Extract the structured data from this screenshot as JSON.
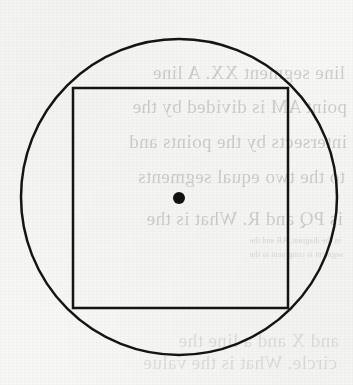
{
  "page": {
    "width": 353,
    "height": 385,
    "background_color": "#f7f7f5",
    "ink_color": "#141414"
  },
  "figure": {
    "name": "circle-with-inscribed-square",
    "stroke_color": "#141414",
    "stroke_width": 2.5,
    "circle": {
      "label": "circle",
      "center_x": 179,
      "center_y": 197,
      "radius": 158
    },
    "square": {
      "label": "inscribed-square",
      "left": 73,
      "top": 88,
      "right": 288,
      "bottom": 308,
      "width": 215,
      "height": 220
    },
    "center_point": {
      "label": "centre",
      "x": 179,
      "y": 198,
      "radius": 6,
      "fill": "#111111"
    }
  },
  "ghost_text": {
    "note": "Faint mirrored show-through text from the reverse of the scanned page",
    "lines": [
      {
        "text": "line segment XX. A line",
        "x": 8,
        "y": 62,
        "size": "main"
      },
      {
        "text": "point AM is divided by the",
        "x": 6,
        "y": 96,
        "size": "main"
      },
      {
        "text": "intersects by the points  and",
        "x": 6,
        "y": 131,
        "size": "main"
      },
      {
        "text": "to the two equal segments",
        "x": 8,
        "y": 166,
        "size": "main"
      },
      {
        "text": "is PQ and R. What is the",
        "x": 10,
        "y": 208,
        "size": "main"
      },
      {
        "text": "in the diagram, AB and the",
        "x": 12,
        "y": 236,
        "size": "small"
      },
      {
        "text": "segment is congruent to the",
        "x": 10,
        "y": 250,
        "size": "small"
      },
      {
        "text": "and X and a line the",
        "x": 14,
        "y": 330,
        "size": "faint"
      },
      {
        "text": "circle. What is the value",
        "x": 16,
        "y": 352,
        "size": "faint"
      }
    ]
  }
}
